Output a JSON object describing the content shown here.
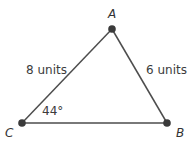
{
  "diagram": {
    "type": "triangle",
    "vertices": {
      "A": {
        "label": "A",
        "x": 112,
        "y": 29
      },
      "B": {
        "label": "B",
        "x": 167,
        "y": 123
      },
      "C": {
        "label": "C",
        "x": 22,
        "y": 123
      }
    },
    "sides": {
      "CA": {
        "label": "8 units",
        "length": 8
      },
      "AB": {
        "label": "6 units",
        "length": 6
      }
    },
    "angles": {
      "C": {
        "label": "44°",
        "value": 44
      }
    },
    "colors": {
      "line": "#4d4d4d",
      "vertex": "#3a3a3a",
      "text": "#3c3c3c"
    }
  }
}
